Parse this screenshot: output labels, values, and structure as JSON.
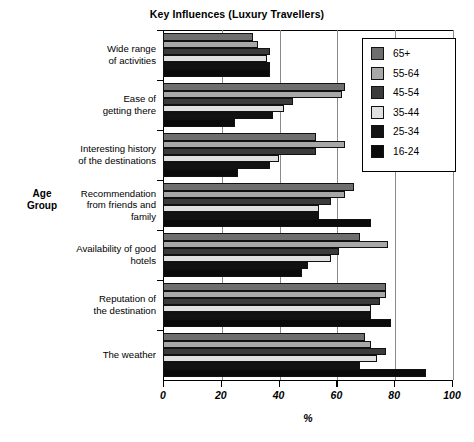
{
  "chart_data": {
    "type": "bar",
    "orientation": "horizontal",
    "title": "Key Influences (Luxury Travellers)",
    "xlabel": "%",
    "ylabel": "Age Group",
    "xlim": [
      0,
      100
    ],
    "xticks": [
      0,
      20,
      40,
      60,
      80,
      100
    ],
    "xticklabels": [
      "0",
      "20",
      "40",
      "60",
      "80",
      "100"
    ],
    "grid": true,
    "legend_position": "upper right",
    "categories": [
      "Wide range of activities",
      "Ease of getting there",
      "Interesting history of the destinations",
      "Recommendation from friends and family",
      "Availability of good hotels",
      "Reputation of the destination",
      "The weather"
    ],
    "category_lines": [
      [
        "Wide range",
        "of activities"
      ],
      [
        "Ease of",
        "getting there"
      ],
      [
        "Interesting history",
        "of the destinations"
      ],
      [
        "Recommendation",
        "from friends and",
        "family"
      ],
      [
        "Availability of good",
        "hotels"
      ],
      [
        "Reputation of",
        "the destination"
      ],
      [
        "The weather"
      ]
    ],
    "series": [
      {
        "name": "65+",
        "color": "#6e6e6e",
        "values": [
          31,
          63,
          53,
          66,
          68,
          77,
          70
        ]
      },
      {
        "name": "55-64",
        "color": "#a8a8a8",
        "values": [
          33,
          62,
          63,
          63,
          78,
          77,
          72
        ]
      },
      {
        "name": "45-54",
        "color": "#3b3b3b",
        "values": [
          37,
          45,
          53,
          58,
          61,
          75,
          77
        ]
      },
      {
        "name": "35-44",
        "color": "#e0e0e0",
        "values": [
          36,
          42,
          40,
          54,
          58,
          72,
          74
        ]
      },
      {
        "name": "25-34",
        "color": "#121212",
        "values": [
          37,
          38,
          37,
          54,
          50,
          72,
          68
        ]
      },
      {
        "name": "16-24",
        "color": "#0a0a0a",
        "values": [
          37,
          25,
          26,
          72,
          48,
          79,
          91
        ]
      }
    ]
  }
}
